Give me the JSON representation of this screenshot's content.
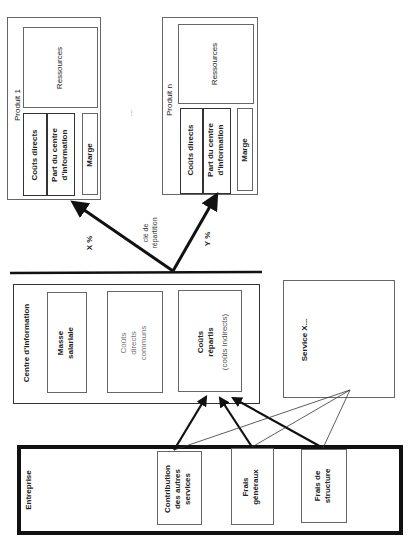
{
  "products": [
    {
      "title": "Produit 1",
      "resources": "Ressources",
      "direct_costs": "Coûts directs",
      "info_center_share_line1": "Part du centre",
      "info_center_share_line2": "d'information",
      "margin": "Marge"
    },
    {
      "title": "Produit n",
      "resources": "Ressources",
      "direct_costs": "Coûts directs",
      "info_center_share_line1": "Part du centre",
      "info_center_share_line2": "d'information",
      "margin": "Marge"
    }
  ],
  "ellipsis": "...",
  "distribution": {
    "key_line1": "clé de",
    "key_line2": "répartition",
    "x_percent": "X %",
    "y_percent": "Y %"
  },
  "info_center": {
    "title": "Centre d'information",
    "payroll_line1": "Masse",
    "payroll_line2": "salariale",
    "common_direct_line1": "Coûts",
    "common_direct_line2": "directs",
    "common_direct_line3": "communs",
    "allocated_line1": "Coûts",
    "allocated_line2": "répartis",
    "allocated_line3": "(coûts indirects)"
  },
  "service": {
    "title": "Service X..."
  },
  "company": {
    "title": "Entreprise",
    "contribution_line1": "Contribution",
    "contribution_line2": "des autres",
    "contribution_line3": "services",
    "overhead_line1": "Frais",
    "overhead_line2": "généraux",
    "structure_line1": "Frais de",
    "structure_line2": "structure"
  },
  "colors": {
    "line": "#111111",
    "box_border": "#555555",
    "text": "#222222",
    "muted_text": "#666666"
  }
}
